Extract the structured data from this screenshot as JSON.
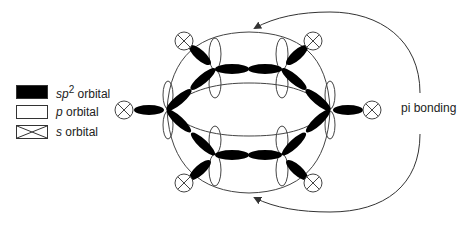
{
  "legend": {
    "items": [
      {
        "key": "sp2",
        "prefix": "sp",
        "sup": "2",
        "suffix": " orbital",
        "fill": "#000000"
      },
      {
        "key": "p",
        "prefix": "p",
        "sup": "",
        "suffix": " orbital",
        "fill": "#ffffff"
      },
      {
        "key": "s",
        "prefix": "s",
        "sup": "",
        "suffix": " orbital",
        "fill": "crossed"
      }
    ]
  },
  "annotation": {
    "pi_label": "pi bonding"
  },
  "figure": {
    "carbon_count": 6,
    "hydrogen_s_orbital_count": 6,
    "colors": {
      "ink": "#000000",
      "line": "#444444",
      "background": "#ffffff"
    }
  }
}
